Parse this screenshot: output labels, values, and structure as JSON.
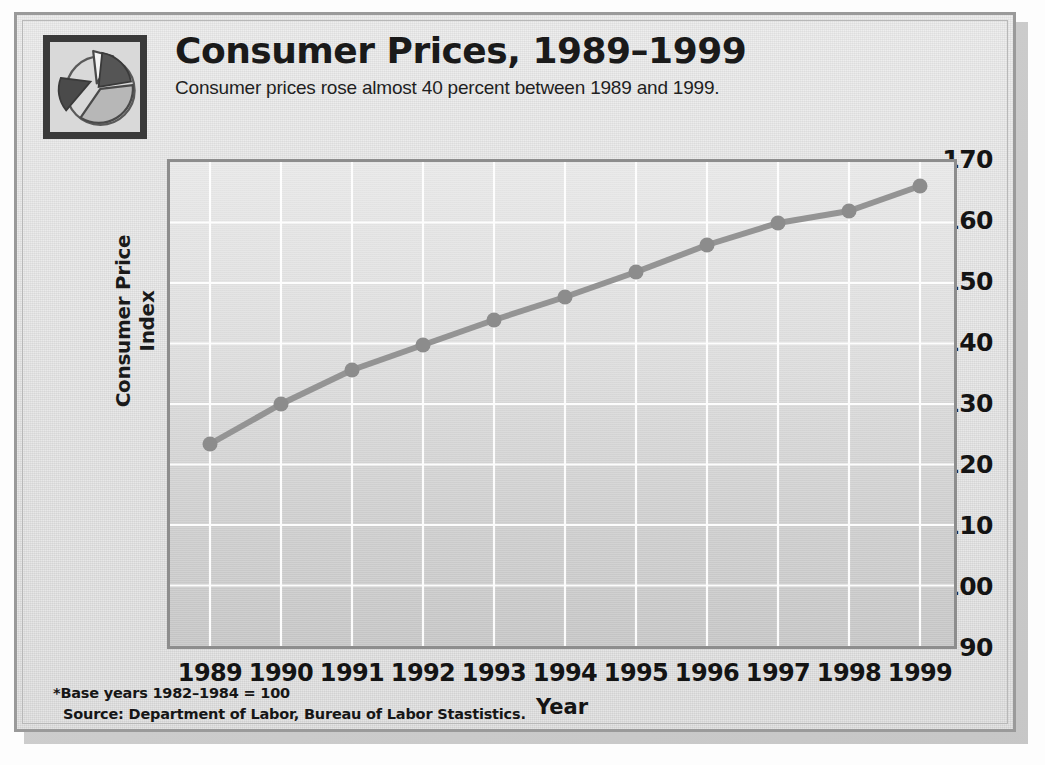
{
  "header": {
    "title": "Consumer Prices, 1989–1999",
    "subtitle": "Consumer prices rose almost 40 percent between 1989 and 1999.",
    "logo_icon": "pie-chart-icon"
  },
  "footnotes": {
    "base_years": "*Base years 1982–1984 = 100",
    "source": "Source: Department of Labor, Bureau of Labor Stastistics."
  },
  "colors": {
    "panel_background": "#dcdcdc",
    "panel_border": "#9a9a9a",
    "plot_border": "#8d8d8d",
    "plot_fill_top": "#e8e8e8",
    "plot_fill_bottom": "#c6c6c6",
    "gridline": "#ffffff",
    "series_line": "#8f8f8f",
    "series_marker": "#8a8a8a",
    "text": "#141414",
    "logo_border": "#3a3a3a",
    "logo_slice_light": "#f2f2f2",
    "logo_slice_mid": "#b5b5b5",
    "logo_slice_dark": "#4f4f4f"
  },
  "chart_data": {
    "type": "line",
    "title": "Consumer Prices, 1989–1999",
    "subtitle": "Consumer prices rose almost 40 percent between 1989 and 1999.",
    "xlabel": "Year",
    "ylabel": "Consumer Price Index",
    "categories": [
      "1989",
      "1990",
      "1991",
      "1992",
      "1993",
      "1994",
      "1995",
      "1996",
      "1997",
      "1998",
      "1999"
    ],
    "x_tick_labels": [
      "1989",
      "1990",
      "1991",
      "1992",
      "1993",
      "1994",
      "1995",
      "1996",
      "1997",
      "1998",
      "1999"
    ],
    "y_tick_labels": [
      "170",
      "160",
      "150",
      "140",
      "130",
      "120",
      "110",
      "*100",
      "90"
    ],
    "y_tick_values": [
      170,
      160,
      150,
      140,
      130,
      120,
      110,
      100,
      90
    ],
    "ylim": [
      90,
      170
    ],
    "grid": true,
    "legend": false,
    "markers": true,
    "values": [
      124.0,
      130.7,
      136.2,
      140.3,
      144.5,
      148.2,
      152.4,
      156.9,
      160.5,
      162.5,
      166.6
    ],
    "annotations": [
      "*Base years 1982–1984 = 100",
      "Source: Department of Labor, Bureau of Labor Stastistics."
    ]
  }
}
